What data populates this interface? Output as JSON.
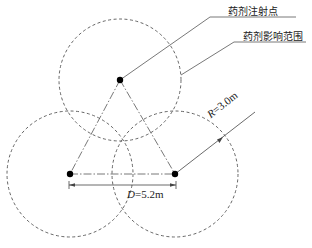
{
  "diagram": {
    "labels": {
      "injection_point": "药剂注射点",
      "influence_range": "药剂影响范围"
    },
    "dimensions": {
      "radius_symbol": "R",
      "radius_value": "=3.0m",
      "spacing_symbol": "D",
      "spacing_value": "=5.2m"
    },
    "points": [
      {
        "name": "top",
        "x": 120,
        "y": 80
      },
      {
        "name": "left",
        "x": 70,
        "y": 174
      },
      {
        "name": "right",
        "x": 175,
        "y": 174
      }
    ],
    "circle_radius_px": 62,
    "colors": {
      "line": "#555555",
      "dot": "#000000",
      "text": "#222222"
    }
  }
}
